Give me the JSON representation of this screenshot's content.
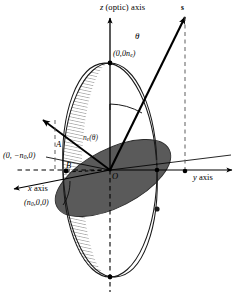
{
  "figure": {
    "background_color": "#ffffff",
    "ink_color": "#000000",
    "ellipse_fill_color": "#5a5a5a",
    "hatch_color": "#9a9a9a",
    "axes": {
      "z": {
        "label": "z (optic) axis",
        "label_italic_part": "z",
        "label_rest": "(optic) axis"
      },
      "y": {
        "label": "y axis",
        "label_italic_part": "y",
        "label_rest": "axis"
      },
      "x": {
        "label": "x axis",
        "label_italic_part": "x",
        "label_rest": "axis"
      }
    },
    "vectors": {
      "s": {
        "label": "s",
        "description": "wave normal direction vector"
      }
    },
    "angles": {
      "theta": {
        "label": "θ",
        "description": "angle between optic axis z and s"
      }
    },
    "coordinate_labels": {
      "z_intercept": {
        "text": "(0,0n",
        "sub": "e",
        "close": ")"
      },
      "negative_y_intercept": {
        "text": "(0, −n",
        "sub": "0",
        "close": ",0)"
      },
      "x_intercept": {
        "text": "(n",
        "sub": "0",
        "close": ",0,0)"
      }
    },
    "point_labels": {
      "A": "A",
      "B": "B",
      "O": "O"
    },
    "curve_labels": {
      "index_ellipse": {
        "text": "n",
        "sub": "e",
        "arg": "(θ)"
      }
    }
  }
}
